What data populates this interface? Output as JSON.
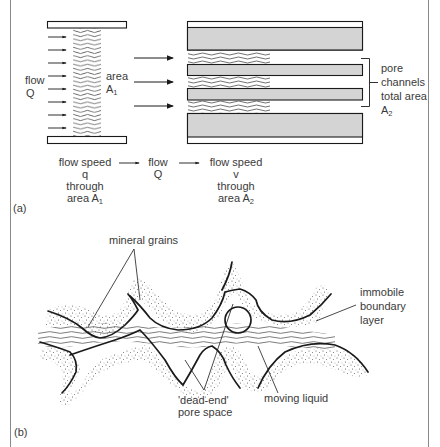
{
  "figure": {
    "panel_a": {
      "tag": "(a)",
      "inlet_label": {
        "line1": "flow",
        "line2": "Q"
      },
      "area1_label": {
        "line1": "area",
        "line2": "A",
        "sub": "1"
      },
      "pore_label": {
        "line1": "pore",
        "line2": "channels",
        "line3": "total area",
        "line4": "A",
        "sub": "2"
      },
      "sequence": {
        "step1": {
          "line1": "flow speed",
          "line2": "q",
          "line3": "through",
          "line4": "area A",
          "sub": "1"
        },
        "step2": {
          "line1": "flow",
          "line2": "Q"
        },
        "step3": {
          "line1": "flow speed",
          "line2": "v",
          "line3": "through",
          "line4": "area A",
          "sub": "2"
        }
      }
    },
    "panel_b": {
      "tag": "(b)",
      "labels": {
        "mineral_grains": "mineral grains",
        "boundary": {
          "line1": "immobile",
          "line2": "boundary",
          "line3": "layer"
        },
        "dead_end": {
          "line1": "'dead-end'",
          "line2": "pore space"
        },
        "moving_liquid": "moving liquid"
      }
    },
    "colors": {
      "line": "#1a1a1a",
      "text": "#3a3a3a",
      "grain_fill": "#d4d4d4",
      "frame": "#8a8a8a",
      "stipple": "#555555"
    }
  }
}
